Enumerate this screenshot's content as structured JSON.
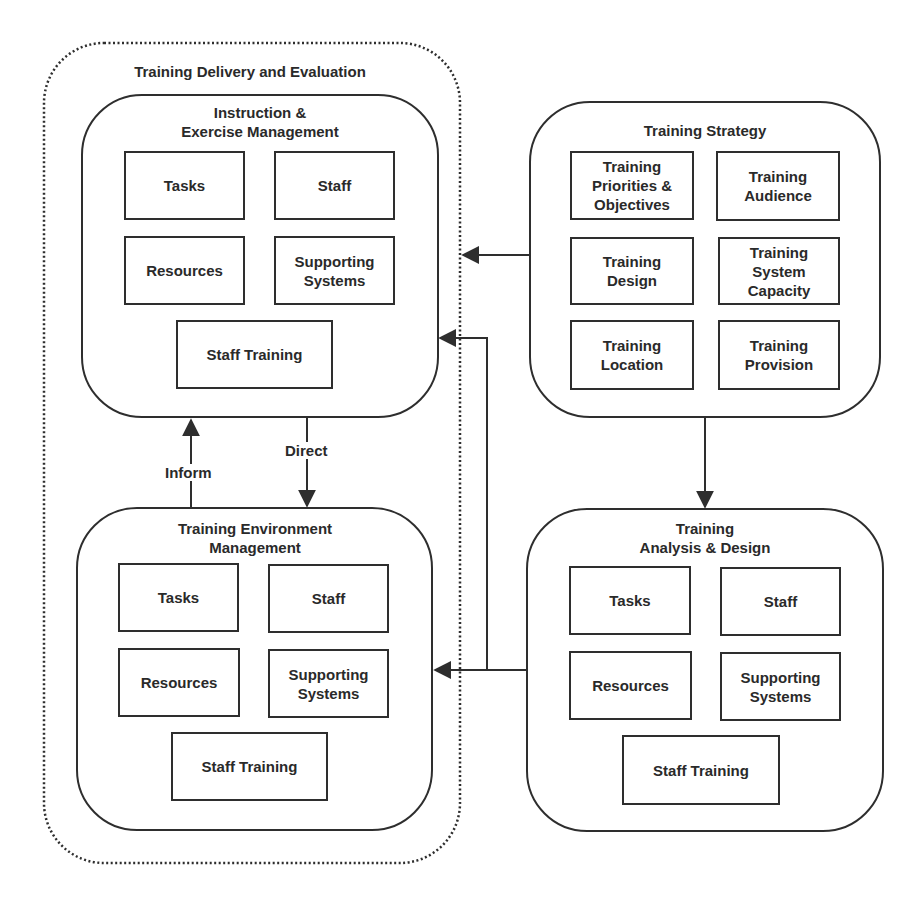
{
  "diagram": {
    "outer_group": {
      "title": "Training Delivery and Evaluation",
      "style": "dotted-rounded"
    },
    "nodes": {
      "instruction": {
        "title": "Instruction &\nExercise Management",
        "items": [
          "Tasks",
          "Staff",
          "Resources",
          "Supporting\nSystems",
          "Staff Training"
        ]
      },
      "environment": {
        "title": "Training Environment\nManagement",
        "items": [
          "Tasks",
          "Staff",
          "Resources",
          "Supporting\nSystems",
          "Staff Training"
        ]
      },
      "strategy": {
        "title": "Training Strategy",
        "items": [
          "Training\nPriorities &\nObjectives",
          "Training\nAudience",
          "Training\nDesign",
          "Training\nSystem\nCapacity",
          "Training\nLocation",
          "Training\nProvision"
        ]
      },
      "analysis": {
        "title": "Training\nAnalysis & Design",
        "items": [
          "Tasks",
          "Staff",
          "Resources",
          "Supporting\nSystems",
          "Staff Training"
        ]
      }
    },
    "edges": [
      {
        "from": "environment",
        "to": "instruction",
        "label": "Inform"
      },
      {
        "from": "instruction",
        "to": "environment",
        "label": "Direct"
      },
      {
        "from": "strategy",
        "to": "outer_group",
        "label": ""
      },
      {
        "from": "strategy",
        "to": "analysis",
        "label": ""
      },
      {
        "from": "analysis",
        "to": "environment",
        "label": ""
      },
      {
        "from": "analysis",
        "to": "instruction",
        "label": ""
      }
    ],
    "colors": {
      "stroke": "#2e2e2e",
      "text": "#2a2a2a",
      "background": "#ffffff"
    }
  }
}
